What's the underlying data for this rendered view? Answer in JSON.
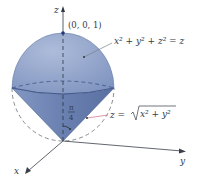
{
  "diagram": {
    "axes": {
      "x": "x",
      "y": "y",
      "z": "z"
    },
    "point_label": "(0, 0, 1)",
    "sphere_equation": "x² + y² + z² = z",
    "cone_equation_lhs": "z = ",
    "cone_equation_radicand": "x² + y²",
    "angle_label_num": "π",
    "angle_label_den": "4",
    "colors": {
      "sphere_fill": "#8fa3c8",
      "cone_fill": "#6f86b6",
      "outline": "#4a5f8f",
      "axis": "#3a3f4a",
      "leader_line": "#d98aa0"
    }
  }
}
